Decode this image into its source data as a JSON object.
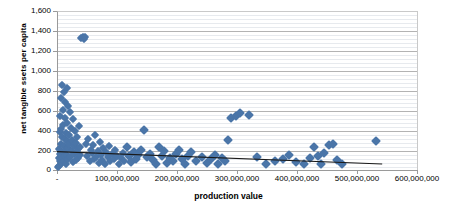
{
  "chart_data": {
    "type": "scatter",
    "title": "",
    "xlabel": "production value",
    "ylabel": "net tangible ssets per capita",
    "xlim": [
      0,
      620000000
    ],
    "ylim": [
      0,
      1600
    ],
    "grid": true,
    "legend": false,
    "marker_color": "#4a75a8",
    "trendline_color": "#1a1a1a",
    "xticks": [
      0,
      100000000,
      200000000,
      300000000,
      400000000,
      500000000,
      600000000
    ],
    "xtick_labels": [
      "-",
      "100,000,000",
      "200,000,000",
      "300,000,000",
      "400,000,000",
      "500,000,000",
      "600,000,000"
    ],
    "yticks": [
      0,
      200,
      400,
      600,
      800,
      1000,
      1200,
      1400,
      1600
    ],
    "ytick_labels": [
      "0",
      "200",
      "400",
      "600",
      "800",
      "1,000",
      "1,200",
      "1,400",
      "1,600"
    ],
    "minor_gridlines_per_major": 4,
    "trendline": {
      "type": "linear",
      "x_start": 0,
      "y_start": 185,
      "x_end": 560000000,
      "y_end": 60
    },
    "x": [
      2000000,
      3000000,
      3500000,
      4000000,
      4500000,
      5000000,
      5500000,
      6000000,
      6500000,
      7000000,
      7500000,
      8000000,
      8500000,
      9000000,
      9500000,
      10000000,
      10500000,
      11000000,
      11500000,
      12000000,
      12500000,
      13000000,
      13500000,
      14000000,
      14500000,
      15000000,
      15500000,
      16000000,
      16500000,
      17000000,
      17500000,
      18000000,
      18500000,
      19000000,
      19500000,
      20000000,
      21000000,
      22000000,
      23000000,
      24000000,
      25000000,
      26000000,
      27000000,
      28000000,
      29000000,
      30000000,
      31000000,
      32000000,
      33000000,
      34000000,
      35000000,
      36000000,
      37000000,
      38000000,
      39000000,
      40000000,
      42000000,
      44000000,
      46000000,
      48000000,
      50000000,
      52000000,
      54000000,
      56000000,
      58000000,
      60000000,
      62000000,
      64000000,
      66000000,
      68000000,
      70000000,
      72000000,
      74000000,
      76000000,
      78000000,
      80000000,
      82000000,
      85000000,
      88000000,
      90000000,
      92000000,
      95000000,
      98000000,
      100000000,
      103000000,
      106000000,
      110000000,
      113000000,
      116000000,
      120000000,
      124000000,
      128000000,
      132000000,
      136000000,
      140000000,
      145000000,
      150000000,
      155000000,
      160000000,
      165000000,
      170000000,
      175000000,
      180000000,
      185000000,
      190000000,
      195000000,
      200000000,
      205000000,
      210000000,
      215000000,
      220000000,
      225000000,
      230000000,
      240000000,
      250000000,
      258000000,
      265000000,
      272000000,
      278000000,
      285000000,
      290000000,
      295000000,
      300000000,
      308000000,
      315000000,
      330000000,
      345000000,
      360000000,
      375000000,
      390000000,
      400000000,
      412000000,
      425000000,
      435000000,
      443000000,
      450000000,
      455000000,
      460000000,
      468000000,
      475000000,
      482000000,
      490000000,
      550000000
    ],
    "y": [
      30,
      120,
      45,
      210,
      380,
      95,
      540,
      160,
      720,
      260,
      410,
      70,
      860,
      330,
      180,
      600,
      120,
      450,
      240,
      780,
      90,
      520,
      310,
      140,
      680,
      200,
      370,
      60,
      830,
      290,
      150,
      470,
      220,
      640,
      110,
      350,
      260,
      580,
      130,
      420,
      190,
      300,
      80,
      510,
      240,
      160,
      390,
      100,
      270,
      180,
      330,
      210,
      120,
      440,
      150,
      230,
      1330,
      1340,
      1320,
      1335,
      260,
      140,
      310,
      90,
      200,
      170,
      250,
      110,
      350,
      130,
      190,
      70,
      280,
      150,
      100,
      220,
      60,
      180,
      130,
      240,
      90,
      160,
      110,
      200,
      140,
      60,
      120,
      175,
      90,
      230,
      140,
      80,
      180,
      110,
      150,
      200,
      400,
      130,
      165,
      100,
      60,
      230,
      140,
      190,
      70,
      120,
      90,
      160,
      200,
      110,
      60,
      140,
      180,
      95,
      130,
      75,
      110,
      150,
      60,
      120,
      90,
      300,
      520,
      545,
      575,
      555,
      130,
      60,
      95,
      110,
      150,
      80,
      60,
      120,
      230,
      140,
      60,
      170,
      255,
      265,
      100,
      60,
      290
    ]
  },
  "axis_titles": {
    "y": "net tangible ssets per capita",
    "x": "production value"
  }
}
